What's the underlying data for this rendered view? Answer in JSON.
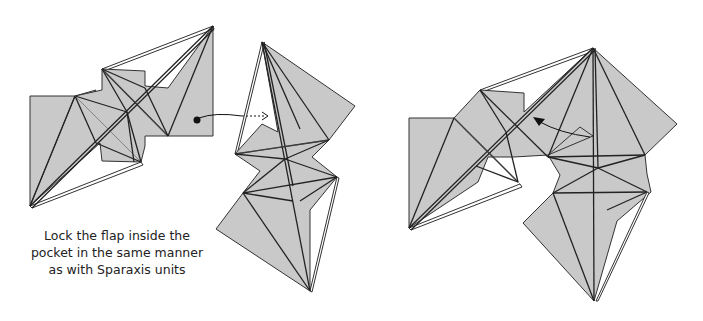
{
  "caption": {
    "lines": [
      "Lock the flap inside the",
      "pocket in the same manner",
      "as with Sparaxis units"
    ]
  },
  "steps": [
    {
      "name": "before",
      "description": "Two units separated; flap marked with dot and curved arrow pointing into pocket"
    },
    {
      "name": "after",
      "description": "Units joined; solid arrow showing flap inserted into pocket"
    }
  ],
  "colors": {
    "paper": "#c9c9c9",
    "line": "#222222",
    "background": "#ffffff"
  }
}
